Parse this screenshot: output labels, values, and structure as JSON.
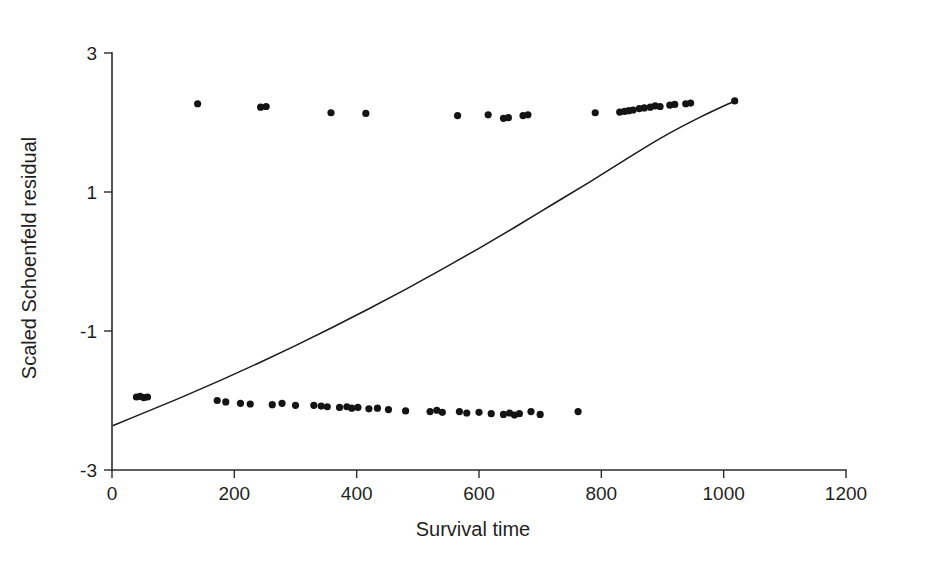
{
  "chart_data": {
    "type": "scatter",
    "title": "",
    "subtitle": "",
    "xlabel": "Survival time",
    "ylabel": "Scaled Schoenfeld residual",
    "xlim": [
      0,
      1200
    ],
    "ylim": [
      -3,
      3
    ],
    "xticks": [
      0,
      200,
      400,
      600,
      800,
      1000,
      1200
    ],
    "yticks": [
      -3,
      -1,
      1,
      3
    ],
    "xtick_labels": [
      "0",
      "200",
      "400",
      "600",
      "800",
      "1000",
      "1200"
    ],
    "ytick_labels": [
      "-3",
      "-1",
      "1",
      "3"
    ],
    "grid": false,
    "legend": false,
    "legend_position": "none",
    "point_color": "#141414",
    "curve_color": "#1a1a1a",
    "axis_color": "#2b2b2b",
    "background_color": "#ffffff",
    "point_radius_px": 3.6,
    "series": [
      {
        "name": "Scaled Schoenfeld residuals",
        "marker": "filled-circle",
        "points": [
          [
            40,
            -1.95
          ],
          [
            46,
            -1.94
          ],
          [
            52,
            -1.96
          ],
          [
            58,
            -1.95
          ],
          [
            140,
            2.27
          ],
          [
            172,
            -2.0
          ],
          [
            186,
            -2.02
          ],
          [
            210,
            -2.04
          ],
          [
            226,
            -2.05
          ],
          [
            243,
            2.22
          ],
          [
            252,
            2.23
          ],
          [
            262,
            -2.06
          ],
          [
            278,
            -2.04
          ],
          [
            300,
            -2.07
          ],
          [
            330,
            -2.07
          ],
          [
            342,
            -2.08
          ],
          [
            352,
            -2.09
          ],
          [
            358,
            2.14
          ],
          [
            372,
            -2.1
          ],
          [
            384,
            -2.09
          ],
          [
            392,
            -2.11
          ],
          [
            402,
            -2.1
          ],
          [
            415,
            2.13
          ],
          [
            420,
            -2.12
          ],
          [
            434,
            -2.11
          ],
          [
            452,
            -2.13
          ],
          [
            480,
            -2.15
          ],
          [
            520,
            -2.16
          ],
          [
            531,
            -2.14
          ],
          [
            540,
            -2.17
          ],
          [
            565,
            2.1
          ],
          [
            568,
            -2.16
          ],
          [
            580,
            -2.18
          ],
          [
            600,
            -2.17
          ],
          [
            615,
            2.11
          ],
          [
            620,
            -2.19
          ],
          [
            640,
            2.06
          ],
          [
            648,
            2.07
          ],
          [
            640,
            -2.2
          ],
          [
            650,
            -2.18
          ],
          [
            658,
            -2.21
          ],
          [
            666,
            -2.19
          ],
          [
            672,
            2.1
          ],
          [
            680,
            2.11
          ],
          [
            685,
            -2.16
          ],
          [
            700,
            -2.2
          ],
          [
            762,
            -2.16
          ],
          [
            790,
            2.14
          ],
          [
            830,
            2.15
          ],
          [
            838,
            2.16
          ],
          [
            845,
            2.17
          ],
          [
            852,
            2.18
          ],
          [
            862,
            2.2
          ],
          [
            870,
            2.21
          ],
          [
            880,
            2.22
          ],
          [
            888,
            2.24
          ],
          [
            896,
            2.23
          ],
          [
            912,
            2.25
          ],
          [
            920,
            2.26
          ],
          [
            938,
            2.27
          ],
          [
            946,
            2.28
          ],
          [
            1018,
            2.31
          ]
        ]
      }
    ],
    "curve": {
      "name": "smoothed trend",
      "points": [
        [
          2,
          -2.36
        ],
        [
          60,
          -2.15
        ],
        [
          120,
          -1.93
        ],
        [
          180,
          -1.7
        ],
        [
          240,
          -1.46
        ],
        [
          300,
          -1.21
        ],
        [
          360,
          -0.95
        ],
        [
          420,
          -0.68
        ],
        [
          480,
          -0.4
        ],
        [
          540,
          -0.11
        ],
        [
          600,
          0.19
        ],
        [
          660,
          0.5
        ],
        [
          720,
          0.82
        ],
        [
          780,
          1.14
        ],
        [
          840,
          1.47
        ],
        [
          900,
          1.79
        ],
        [
          960,
          2.07
        ],
        [
          1018,
          2.31
        ]
      ]
    }
  }
}
